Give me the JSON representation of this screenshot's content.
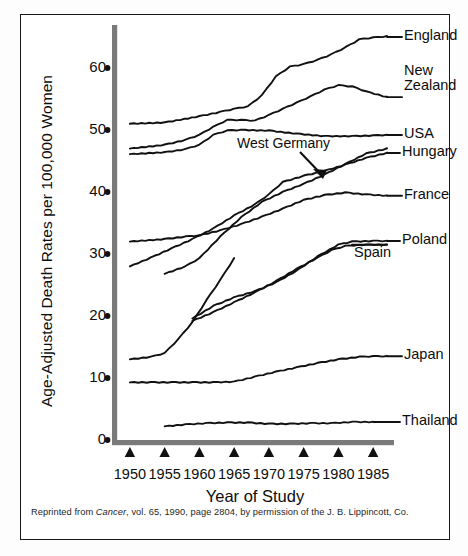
{
  "figure": {
    "y_axis_title": "Age-Adjusted Death Rates per 100,000 Women",
    "x_axis_title": "Year of Study",
    "annotation": "West Germany",
    "caption_prefix": "Reprinted from ",
    "caption_journal": "Cancer",
    "caption_suffix": ", vol. 65, 1990, page 2804, by permission of the J. B. Lippincott, Co."
  },
  "chart_data": {
    "type": "line",
    "title": "",
    "xlabel": "Year of Study",
    "ylabel": "Age-Adjusted Death Rates per 100,000 Women",
    "xlim": [
      1948,
      1988
    ],
    "ylim": [
      0,
      65
    ],
    "xticks": [
      1950,
      1955,
      1960,
      1965,
      1970,
      1975,
      1980,
      1985
    ],
    "yticks": [
      0,
      10,
      20,
      30,
      40,
      50,
      60
    ],
    "grid": false,
    "legend": "inline-right-labels",
    "tick_marker_x": "triangle",
    "tick_marker_y": "dot",
    "annotations": [
      {
        "text": "West Germany",
        "points_to_series": "West Germany",
        "x": 1970,
        "y": 43.5
      }
    ],
    "series": [
      {
        "name": "England",
        "label": "England",
        "x": [
          1950,
          1955,
          1960,
          1963,
          1965,
          1967,
          1969,
          1971,
          1973,
          1975,
          1977,
          1979,
          1981,
          1983,
          1985,
          1987
        ],
        "values": [
          51.0,
          51.2,
          52.2,
          52.9,
          53.4,
          53.8,
          55.6,
          58.6,
          60.2,
          60.6,
          61.3,
          62.2,
          63.3,
          64.6,
          64.9,
          65.1
        ]
      },
      {
        "name": "New Zealand",
        "label": "New Zealand",
        "x": [
          1950,
          1955,
          1958,
          1960,
          1962,
          1964,
          1966,
          1968,
          1970,
          1972,
          1974,
          1976,
          1978,
          1980,
          1982,
          1984,
          1987
        ],
        "values": [
          47.0,
          47.6,
          48.4,
          49.2,
          50.5,
          51.6,
          51.6,
          51.5,
          52.4,
          53.4,
          54.4,
          55.4,
          56.5,
          57.2,
          57.0,
          56.2,
          55.3
        ]
      },
      {
        "name": "USA",
        "label": "USA",
        "x": [
          1950,
          1955,
          1958,
          1960,
          1962,
          1964,
          1966,
          1970,
          1974,
          1978,
          1982,
          1985,
          1987
        ],
        "values": [
          46.1,
          46.4,
          46.9,
          47.6,
          49.2,
          49.9,
          50.0,
          49.9,
          49.4,
          49.0,
          49.0,
          49.1,
          49.2
        ]
      },
      {
        "name": "West Germany",
        "label": "",
        "x": [
          1955,
          1958,
          1960,
          1963,
          1966,
          1969,
          1972,
          1975,
          1978,
          1981,
          1984,
          1987
        ],
        "values": [
          26.8,
          28.0,
          29.3,
          32.8,
          35.9,
          38.4,
          40.0,
          41.3,
          42.8,
          44.5,
          46.2,
          47.0
        ]
      },
      {
        "name": "Hungary",
        "label": "Hungary",
        "x": [
          1950,
          1953,
          1956,
          1959,
          1962,
          1965,
          1968,
          1970,
          1972,
          1975,
          1978,
          1981,
          1984,
          1987
        ],
        "values": [
          28.0,
          29.4,
          30.9,
          32.4,
          34.1,
          36.2,
          38.0,
          39.6,
          41.6,
          42.6,
          43.4,
          44.4,
          45.5,
          46.3
        ]
      },
      {
        "name": "France",
        "label": "France",
        "x": [
          1950,
          1955,
          1958,
          1960,
          1963,
          1966,
          1969,
          1972,
          1975,
          1978,
          1981,
          1984,
          1987
        ],
        "values": [
          32.0,
          32.4,
          32.8,
          33.0,
          33.8,
          34.8,
          36.0,
          37.3,
          38.7,
          39.5,
          39.9,
          39.6,
          39.4
        ]
      },
      {
        "name": "Poland",
        "label": "Poland",
        "x": [
          1959,
          1962,
          1965,
          1968,
          1971,
          1974,
          1977,
          1980,
          1982,
          1985,
          1987
        ],
        "values": [
          19.6,
          21.6,
          23.0,
          24.0,
          25.4,
          27.3,
          29.6,
          31.5,
          32.0,
          32.1,
          32.1
        ]
      },
      {
        "name": "Spain",
        "label": "Spain",
        "x": [
          1959,
          1962,
          1965,
          1968,
          1971,
          1974,
          1977,
          1979,
          1981,
          1984,
          1987
        ],
        "values": [
          19.2,
          20.6,
          22.2,
          23.8,
          25.6,
          27.6,
          29.4,
          30.6,
          31.3,
          31.5,
          31.5
        ]
      },
      {
        "name": "Japan_lower",
        "label": "Japan",
        "x": [
          1950,
          1953,
          1956,
          1959,
          1962,
          1965,
          1968,
          1971,
          1974,
          1977,
          1980,
          1983,
          1985,
          1987
        ],
        "values": [
          9.3,
          9.3,
          9.3,
          9.3,
          9.3,
          9.4,
          10.2,
          11.0,
          11.7,
          12.4,
          13.0,
          13.4,
          13.5,
          13.5
        ]
      },
      {
        "name": "Thailand",
        "label": "Thailand",
        "x": [
          1955,
          1958,
          1961,
          1964,
          1967,
          1970,
          1973,
          1976,
          1979,
          1982,
          1985
        ],
        "values": [
          2.2,
          2.5,
          2.7,
          2.8,
          2.8,
          2.6,
          2.6,
          2.7,
          2.7,
          2.9,
          2.9
        ]
      },
      {
        "name": "Poland_early",
        "label": "",
        "x": [
          1950,
          1953,
          1955,
          1957,
          1959,
          1961,
          1963,
          1965
        ],
        "values": [
          13.0,
          13.4,
          14.0,
          16.3,
          19.0,
          22.5,
          25.8,
          29.3
        ]
      }
    ],
    "series_labels": [
      {
        "name": "England",
        "text": "England",
        "y_value": 65.0
      },
      {
        "name": "New Zealand",
        "text": "New Zealand",
        "y_value": 57.0
      },
      {
        "name": "USA",
        "text": "USA",
        "y_value": 49.2
      },
      {
        "name": "Hungary",
        "text": "Hungary",
        "y_value": 46.3
      },
      {
        "name": "France",
        "text": "France",
        "y_value": 39.4
      },
      {
        "name": "Poland",
        "text": "Poland",
        "y_value": 32.1
      },
      {
        "name": "Spain",
        "text": "Spain",
        "y_value": 30.0
      },
      {
        "name": "Japan",
        "text": "Japan",
        "y_value": 13.5
      },
      {
        "name": "Thailand",
        "text": "Thailand",
        "y_value": 2.9
      }
    ]
  },
  "colors": {
    "line": "#111111",
    "axis": "#7a7a7a",
    "text": "#0d0d0d",
    "frame": "#1a1a1a",
    "background": "#ffffff"
  }
}
